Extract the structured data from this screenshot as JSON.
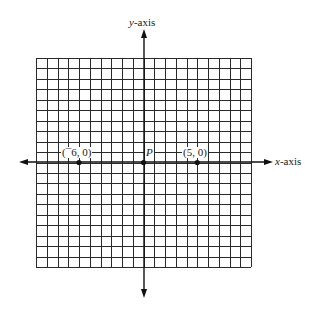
{
  "diagram": {
    "grid": {
      "columns": 20,
      "rows": 20,
      "x_min": -10,
      "x_max": 10,
      "y_min": -10,
      "y_max": 10
    },
    "axes": {
      "x_label_var": "x",
      "x_label_suffix": "-axis",
      "y_label_var": "y",
      "y_label_suffix": "-axis"
    },
    "points": [
      {
        "id": "neg6",
        "x": -6,
        "y": 0,
        "label": "(¯6, 0)"
      },
      {
        "id": "origin",
        "x": 0,
        "y": 0,
        "label": "P"
      },
      {
        "id": "pos5",
        "x": 5,
        "y": 0,
        "label": "(5, 0)"
      }
    ],
    "colors": {
      "line": "#1a1a1a",
      "background": "#ffffff"
    }
  }
}
